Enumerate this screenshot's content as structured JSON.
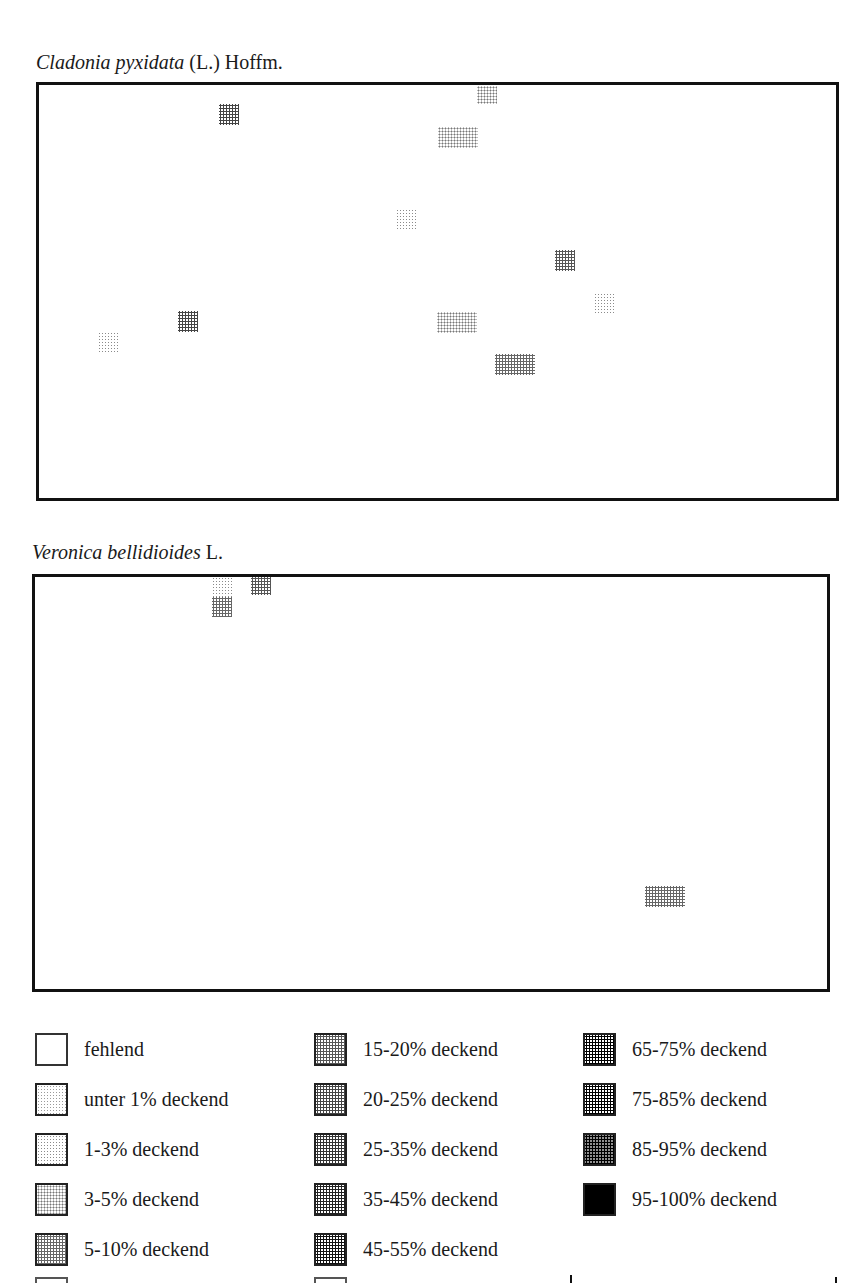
{
  "maps": [
    {
      "title_italic": "Cladonia pyxidata",
      "title_rest": " (L.) Hoffm.",
      "title_pos": {
        "x": 36,
        "y": 50
      },
      "box": {
        "x": 36,
        "y": 82,
        "w": 803,
        "h": 419
      },
      "patches": [
        {
          "x": 219,
          "y": 104,
          "w": 20,
          "h": 21,
          "level": 6
        },
        {
          "x": 477,
          "y": 86,
          "w": 20,
          "h": 18,
          "level": 3
        },
        {
          "x": 438,
          "y": 127,
          "w": 40,
          "h": 21,
          "level": 3
        },
        {
          "x": 396,
          "y": 209,
          "w": 20,
          "h": 21,
          "level": 2
        },
        {
          "x": 555,
          "y": 250,
          "w": 20,
          "h": 21,
          "level": 5
        },
        {
          "x": 594,
          "y": 293,
          "w": 20,
          "h": 21,
          "level": 2
        },
        {
          "x": 178,
          "y": 311,
          "w": 20,
          "h": 21,
          "level": 6
        },
        {
          "x": 437,
          "y": 312,
          "w": 40,
          "h": 21,
          "level": 3
        },
        {
          "x": 98,
          "y": 332,
          "w": 20,
          "h": 21,
          "level": 2
        },
        {
          "x": 495,
          "y": 354,
          "w": 40,
          "h": 21,
          "level": 4
        }
      ]
    },
    {
      "title_italic": "Veronica bellidioides",
      "title_rest": " L.",
      "title_pos": {
        "x": 32,
        "y": 540
      },
      "box": {
        "x": 32,
        "y": 574,
        "w": 798,
        "h": 418
      },
      "patches": [
        {
          "x": 212,
          "y": 577,
          "w": 20,
          "h": 20,
          "level": 2
        },
        {
          "x": 212,
          "y": 597,
          "w": 20,
          "h": 20,
          "level": 4
        },
        {
          "x": 251,
          "y": 577,
          "w": 20,
          "h": 18,
          "level": 5
        },
        {
          "x": 645,
          "y": 886,
          "w": 40,
          "h": 21,
          "level": 4
        }
      ]
    }
  ],
  "legend": {
    "items": [
      {
        "label": "fehlend",
        "level": 0,
        "x": 35,
        "y": 1032
      },
      {
        "label": "unter 1% deckend",
        "level": 1,
        "x": 35,
        "y": 1082
      },
      {
        "label": "1-3% deckend",
        "level": 2,
        "x": 35,
        "y": 1132
      },
      {
        "label": "3-5% deckend",
        "level": 3,
        "x": 35,
        "y": 1182
      },
      {
        "label": "5-10% deckend",
        "level": 4,
        "x": 35,
        "y": 1232
      },
      {
        "label": "15-20% deckend",
        "level": 5,
        "x": 314,
        "y": 1032
      },
      {
        "label": "20-25% deckend",
        "level": 6,
        "x": 314,
        "y": 1082
      },
      {
        "label": "25-35% deckend",
        "level": 7,
        "x": 314,
        "y": 1132
      },
      {
        "label": "35-45% deckend",
        "level": 8,
        "x": 314,
        "y": 1182
      },
      {
        "label": "45-55% deckend",
        "level": 9,
        "x": 314,
        "y": 1232
      },
      {
        "label": "65-75% deckend",
        "level": 10,
        "x": 583,
        "y": 1032
      },
      {
        "label": "75-85% deckend",
        "level": 11,
        "x": 583,
        "y": 1082
      },
      {
        "label": "85-95% deckend",
        "level": 12,
        "x": 583,
        "y": 1132
      },
      {
        "label": "95-100% deckend",
        "level": 14,
        "x": 583,
        "y": 1182
      }
    ]
  }
}
